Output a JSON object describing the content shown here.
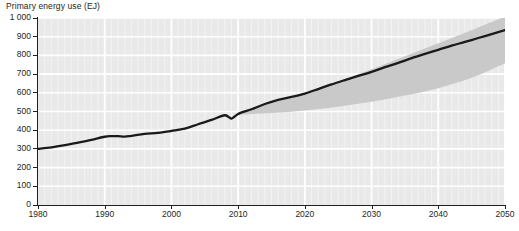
{
  "chart_data": {
    "type": "line",
    "title": "Primary energy use (EJ)",
    "xlabel": "",
    "ylabel": "Primary energy use (EJ)",
    "xlim": [
      1980,
      2050
    ],
    "ylim": [
      0,
      1000
    ],
    "ytick_labels": [
      "0",
      "100",
      "200",
      "300",
      "400",
      "500",
      "600",
      "700",
      "800",
      "900",
      "1 000"
    ],
    "ytick_values": [
      0,
      100,
      200,
      300,
      400,
      500,
      600,
      700,
      800,
      900,
      1000
    ],
    "xtick_labels": [
      "1980",
      "1990",
      "2000",
      "2010",
      "2020",
      "2030",
      "2040",
      "2050"
    ],
    "xtick_values": [
      1980,
      1990,
      2000,
      2010,
      2020,
      2030,
      2040,
      2050
    ],
    "grid": true,
    "grid_minor_x": "annual",
    "legend": "none",
    "series": [
      {
        "name": "Primary energy use",
        "type": "line",
        "color": "#1a1a1a",
        "x": [
          1980,
          1982,
          1984,
          1986,
          1988,
          1990,
          1991,
          1992,
          1993,
          1994,
          1996,
          1998,
          2000,
          2002,
          2004,
          2006,
          2008,
          2009,
          2010,
          2012,
          2014,
          2016,
          2018,
          2020,
          2022,
          2024,
          2026,
          2028,
          2030,
          2032,
          2034,
          2036,
          2038,
          2040,
          2042,
          2044,
          2046,
          2048,
          2050
        ],
        "values": [
          300,
          308,
          320,
          333,
          348,
          365,
          368,
          368,
          366,
          370,
          380,
          386,
          396,
          408,
          432,
          455,
          480,
          462,
          487,
          512,
          540,
          562,
          578,
          596,
          620,
          645,
          668,
          690,
          712,
          737,
          760,
          785,
          808,
          830,
          852,
          872,
          893,
          914,
          935
        ]
      },
      {
        "name": "Uncertainty range",
        "type": "band",
        "color": "#c9c9c9",
        "x": [
          2010,
          2015,
          2020,
          2025,
          2030,
          2035,
          2040,
          2045,
          2050
        ],
        "upper": [
          492,
          545,
          600,
          660,
          726,
          795,
          865,
          935,
          1008
        ],
        "lower": [
          482,
          492,
          506,
          526,
          552,
          585,
          625,
          680,
          758
        ]
      }
    ]
  },
  "style": {
    "plot_background": "#e9e9e9",
    "gridline_color": "#ffffff",
    "minor_gridline_color": "#f4f4f4",
    "axis_color": "#231f20",
    "line_color": "#1a1a1a",
    "band_color": "#c9c9c9"
  }
}
